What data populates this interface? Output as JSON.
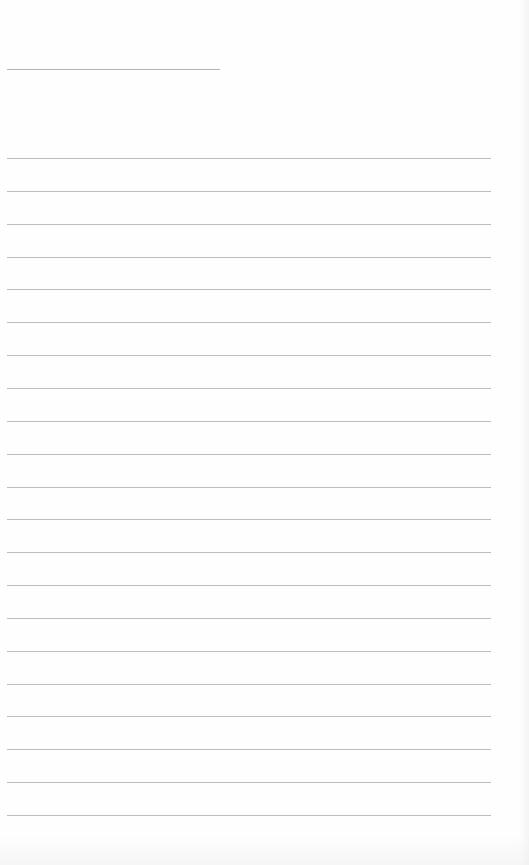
{
  "document": {
    "type": "lined-paper",
    "header_line": {
      "label": ""
    },
    "ruled_lines": {
      "count": 21,
      "first_y": 158,
      "spacing": 32.85
    },
    "colors": {
      "paper": "#fefefe",
      "rule": "#bdbdbd"
    }
  }
}
